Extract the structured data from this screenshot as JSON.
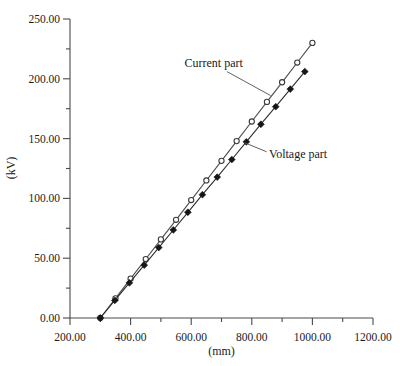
{
  "figure": {
    "background": "#ffffff",
    "axis_color": "#4a4a4a",
    "text_color": "#1b1b1b"
  },
  "chart_data": {
    "type": "line",
    "title": "",
    "xlabel": "(mm)",
    "ylabel": "(kV)",
    "xlim": [
      200,
      1200
    ],
    "ylim": [
      0,
      250
    ],
    "grid": false,
    "legend_position": "inline-annotations",
    "x_major_ticks": [
      200,
      400,
      600,
      800,
      1000,
      1200
    ],
    "x_major_tick_labels": [
      "200.00",
      "400.00",
      "600.00",
      "800.00",
      "1000.00",
      "1200.00"
    ],
    "x_minor_ticks": [
      300,
      500,
      700,
      900,
      1100
    ],
    "y_major_ticks": [
      0,
      50,
      100,
      150,
      200,
      250
    ],
    "y_major_tick_labels": [
      "0.00",
      "50.00",
      "100.00",
      "150.00",
      "200.00",
      "250.00"
    ],
    "y_minor_ticks": [
      25,
      75,
      125,
      175,
      225
    ],
    "series": [
      {
        "name": "Current part",
        "marker": "open-circle",
        "line_color": "#4a4a4a",
        "marker_stroke": "#3a3a3a",
        "marker_fill": "#ffffff",
        "x": [
          300,
          350,
          400,
          450,
          500,
          550,
          600,
          650,
          700,
          750,
          800,
          850,
          900,
          950,
          1000
        ],
        "y": [
          0,
          16.4,
          32.9,
          49.3,
          65.7,
          82.1,
          98.6,
          115.0,
          131.4,
          147.9,
          164.3,
          180.7,
          197.1,
          213.6,
          230.0
        ]
      },
      {
        "name": "Voltage part",
        "marker": "filled-diamond",
        "line_color": "#2e2e2e",
        "marker_stroke": "#161616",
        "marker_fill": "#161616",
        "x": [
          300,
          348,
          396,
          445,
          493,
          541,
          589,
          637,
          686,
          734,
          782,
          830,
          879,
          927,
          975
        ],
        "y": [
          0,
          14.7,
          29.4,
          44.2,
          58.9,
          73.6,
          88.4,
          103.1,
          117.8,
          132.5,
          147.3,
          162.0,
          176.7,
          191.4,
          206.0
        ]
      }
    ],
    "annotations": [
      {
        "text": "Current part",
        "text_anchor": "start",
        "text_x": 578,
        "text_y": 210,
        "line_from": [
          718,
          206
        ],
        "line_to": [
          862,
          186
        ]
      },
      {
        "text": "Voltage part",
        "text_anchor": "start",
        "text_x": 857,
        "text_y": 134,
        "line_from": [
          849,
          139
        ],
        "line_to": [
          772,
          147
        ]
      }
    ]
  }
}
